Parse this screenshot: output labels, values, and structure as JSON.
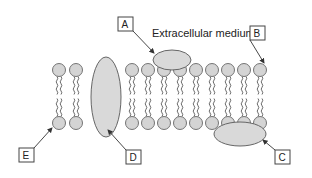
{
  "diagram": {
    "title_label": "Extracellular medium",
    "labels": [
      {
        "id": "A",
        "text": "A",
        "target": "peripheral-protein-top"
      },
      {
        "id": "B",
        "text": "B",
        "target": "phospholipid-head-top-right"
      },
      {
        "id": "C",
        "text": "C",
        "target": "peripheral-protein-bottom"
      },
      {
        "id": "D",
        "text": "D",
        "target": "integral-protein"
      },
      {
        "id": "E",
        "text": "E",
        "target": "phospholipid-head-bottom-left"
      }
    ],
    "colors": {
      "fill": "#d9d9d9",
      "stroke": "#555555",
      "line": "#333333"
    }
  }
}
